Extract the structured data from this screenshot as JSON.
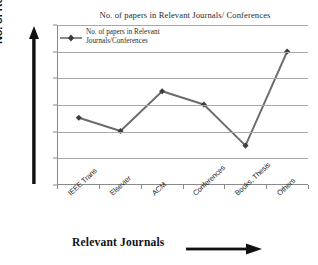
{
  "chart_data": {
    "type": "line",
    "title": "No. of papers in Relevant Journals/ Conferences",
    "xlabel": "Relevant Journals",
    "ylabel": "No. of Research Papers",
    "categories": [
      "IEEE Trans",
      "Elsevier",
      "ACM",
      "Conferences",
      "Books, Thesis",
      "Others"
    ],
    "values": [
      5,
      4,
      7,
      6,
      2.9,
      10
    ],
    "series": [
      {
        "name": "No. of papers in Relevant Journals/Conferences",
        "values": [
          5,
          4,
          7,
          6,
          2.9,
          10
        ]
      }
    ],
    "ylim": [
      0,
      12
    ],
    "ytick_values": [
      0,
      2,
      4,
      6,
      8,
      10,
      12
    ],
    "ytick_labels": [
      "0",
      "2",
      "4",
      "6",
      "8",
      "10",
      "12"
    ],
    "grid": "horizontal",
    "legend_position": "top-left-inside",
    "marker": "diamond",
    "series_color": "#6b6b6b",
    "grid_color": "#a8a8a8",
    "axis_color": "#8a8a8a",
    "text_color": "#1d1d1d"
  },
  "legend": {
    "entries": [
      {
        "line1": "No. of papers in Relevant",
        "line2": "Journals/Conferences"
      }
    ]
  },
  "axes": {
    "x_title": "Relevant Journals",
    "y_title": "No. of Research Papers"
  }
}
